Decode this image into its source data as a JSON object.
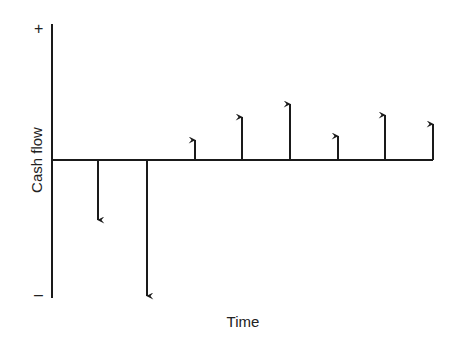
{
  "diagram": {
    "type": "cash-flow-diagram",
    "xlabel": "Time",
    "ylabel": "Cash flow",
    "positive_marker": "+",
    "negative_marker": "–",
    "line_color": "#1a1a1a"
  },
  "chart_data": {
    "type": "cash-flow-arrows",
    "title": "",
    "xlabel": "Time",
    "ylabel": "Cash flow",
    "periods": [
      1,
      2,
      3,
      4,
      5,
      6,
      7,
      8
    ],
    "values": [
      -60,
      -136,
      20,
      43,
      56,
      24,
      45,
      36
    ],
    "value_units": "relative (arrow length in px)"
  }
}
